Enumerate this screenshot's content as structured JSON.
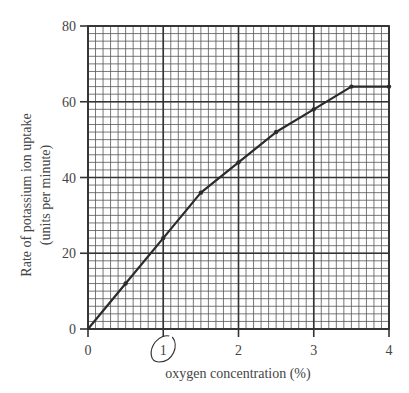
{
  "chart_data": {
    "type": "line",
    "title": "",
    "xlabel": "oxygen concentration (%)",
    "ylabel_lines": [
      "Rate of potassium ion uptake",
      "(units per minute)"
    ],
    "ylabel": "Rate of potassium ion uptake (units per minute)",
    "xlim": [
      0,
      4
    ],
    "ylim": [
      0,
      80
    ],
    "x_ticks": [
      0,
      1,
      2,
      3,
      4
    ],
    "y_ticks": [
      0,
      20,
      40,
      60,
      80
    ],
    "x_minor_step": 0.1,
    "y_minor_step": 2,
    "grid": true,
    "legend": null,
    "series": [
      {
        "name": "Potassium ion uptake",
        "color": "#2b2b2b",
        "x": [
          0,
          0.5,
          1,
          1.5,
          2,
          2.5,
          3,
          3.5,
          4
        ],
        "y": [
          0,
          12,
          24,
          36,
          44,
          52,
          58,
          64,
          64
        ]
      }
    ],
    "annotations": [
      {
        "type": "hand-drawn-circle",
        "around_x_tick": 1
      }
    ]
  },
  "colors": {
    "grid_minor": "#555555",
    "grid_major": "#333333",
    "line": "#2b2b2b",
    "text": "#444444"
  }
}
